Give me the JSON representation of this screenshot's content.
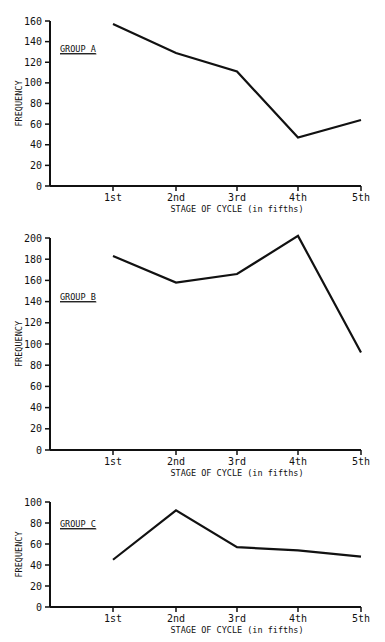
{
  "chart_data": [
    {
      "type": "line",
      "title": "GROUP A",
      "xlabel": "STAGE OF CYCLE (in fifths)",
      "ylabel": "FREQUENCY",
      "categories": [
        "1st",
        "2nd",
        "3rd",
        "4th",
        "5th"
      ],
      "values": [
        157,
        129,
        111,
        47,
        64
      ],
      "yticks": [
        0,
        20,
        40,
        60,
        80,
        100,
        120,
        140,
        160
      ],
      "ylim": [
        0,
        160
      ],
      "grid": false,
      "legend": "none"
    },
    {
      "type": "line",
      "title": "GROUP B",
      "xlabel": "STAGE OF CYCLE (in fifths)",
      "ylabel": "FREQUENCY",
      "categories": [
        "1st",
        "2nd",
        "3rd",
        "4th",
        "5th"
      ],
      "values": [
        183,
        158,
        166,
        202,
        92
      ],
      "yticks": [
        0,
        20,
        40,
        60,
        80,
        100,
        120,
        140,
        160,
        180,
        200
      ],
      "ylim": [
        0,
        200
      ],
      "grid": false,
      "legend": "none"
    },
    {
      "type": "line",
      "title": "GROUP C",
      "xlabel": "STAGE OF CYCLE (in fifths)",
      "ylabel": "FREQUENCY",
      "categories": [
        "1st",
        "2nd",
        "3rd",
        "4th",
        "5th"
      ],
      "values": [
        45,
        92,
        57,
        54,
        48
      ],
      "yticks": [
        0,
        20,
        40,
        60,
        80,
        100
      ],
      "ylim": [
        0,
        100
      ],
      "grid": false,
      "legend": "none"
    }
  ],
  "panels": [
    {
      "group_label": "GROUP A",
      "ylabel": "FREQUENCY",
      "xlabel": "STAGE OF CYCLE (in fifths)"
    },
    {
      "group_label": "GROUP B",
      "ylabel": "FREQUENCY",
      "xlabel": "STAGE OF CYCLE (in fifths)"
    },
    {
      "group_label": "GROUP C",
      "ylabel": "FREQUENCY",
      "xlabel": "STAGE OF CYCLE (in fifths)"
    }
  ],
  "colors": {
    "line": "#111111",
    "axis": "#111111",
    "background": "#ffffff"
  }
}
